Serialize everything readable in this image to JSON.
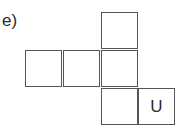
{
  "figure": {
    "label": "e)",
    "net": {
      "description": "cube net of six squares",
      "squares": [
        {
          "row": 0,
          "col": 2,
          "text": ""
        },
        {
          "row": 1,
          "col": 0,
          "text": ""
        },
        {
          "row": 1,
          "col": 1,
          "text": ""
        },
        {
          "row": 1,
          "col": 2,
          "text": ""
        },
        {
          "row": 2,
          "col": 2,
          "text": ""
        },
        {
          "row": 2,
          "col": 3,
          "text": "U"
        }
      ]
    }
  }
}
